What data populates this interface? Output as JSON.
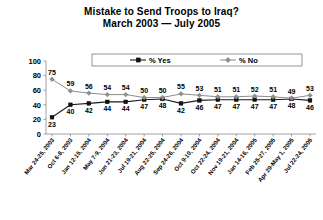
{
  "chart_data": {
    "type": "line",
    "title": "Mistake to Send Troops to Iraq?",
    "subtitle": "March 2003 — July 2005",
    "xlabel": "",
    "ylabel": "",
    "ylim": [
      0,
      100
    ],
    "yticks": [
      0,
      20,
      40,
      60,
      80,
      100
    ],
    "grid": false,
    "legend_position": "top-center",
    "categories": [
      "Mar 24-25, 2003",
      "Oct 6-8, 2003",
      "Jan 12-15, 2004",
      "May 7-9, 2004",
      "Jun 21-23, 2004",
      "Jul 19-21, 2004",
      "Aug 22-25, 2004",
      "Sep 24-26, 2004",
      "Oct 9-10, 2004",
      "Oct 22-24, 2004",
      "Nov 19-21, 2004",
      "Jan 14-16, 2005",
      "Feb 25-27, 2005",
      "Apr 29-May 1, 2005",
      "Jul 22-24, 2005"
    ],
    "series": [
      {
        "name": "% Yes",
        "marker": "square",
        "color": "#111111",
        "values": [
          23,
          40,
          42,
          44,
          44,
          47,
          48,
          42,
          46,
          47,
          47,
          47,
          47,
          48,
          46
        ]
      },
      {
        "name": "% No",
        "marker": "diamond",
        "color": "#8d8d8d",
        "values": [
          75,
          59,
          56,
          54,
          54,
          50,
          50,
          55,
          53,
          51,
          51,
          52,
          51,
          49,
          53
        ]
      }
    ]
  },
  "legend": {
    "entries": [
      {
        "label": "% Yes"
      },
      {
        "label": "% No"
      }
    ]
  }
}
